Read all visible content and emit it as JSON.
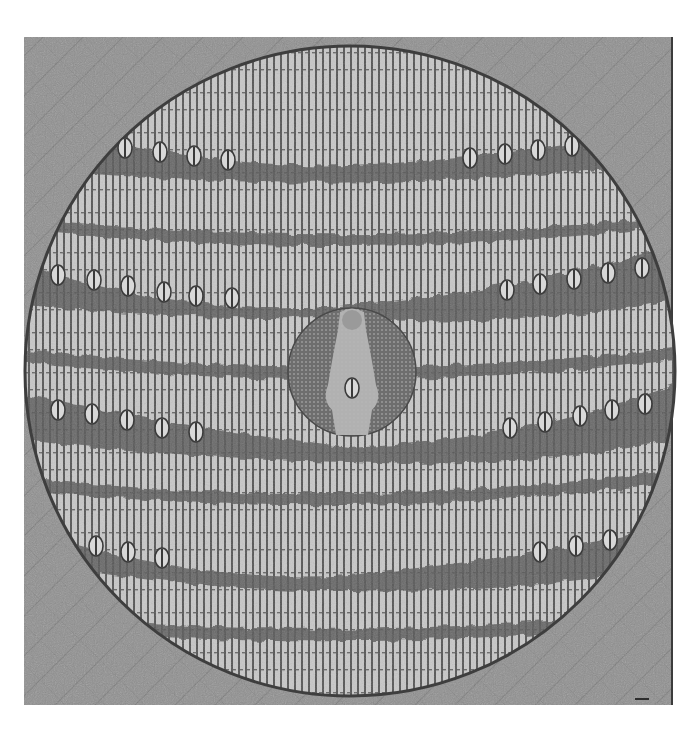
{
  "image": {
    "subject": "photograph of a square painting with a large circular woven-texture disc",
    "background_color": "#ffffff",
    "panel": {
      "x": 24,
      "y": 37,
      "width": 648,
      "height": 668,
      "color": "#8e8e8e"
    },
    "disc": {
      "cx": 350,
      "cy": 371,
      "r": 325,
      "base_color": "#c4c4c4",
      "stripe_color": "#5e5e5e",
      "stripe_spacing": 7
    },
    "bands": [
      {
        "y_left": 150,
        "y_mid": 165,
        "y_right": 148,
        "eyes": "both-sides"
      },
      {
        "y_left": 218,
        "y_mid": 238,
        "y_right": 215,
        "eyes": "none"
      },
      {
        "y_left": 282,
        "y_mid": 300,
        "y_right": 275,
        "eyes": "both-sides"
      },
      {
        "y_left": 350,
        "y_mid": 368,
        "y_right": 348,
        "eyes": "none"
      },
      {
        "y_left": 415,
        "y_mid": 440,
        "y_right": 410,
        "eyes": "both-sides"
      },
      {
        "y_left": 478,
        "y_mid": 495,
        "y_right": 470,
        "eyes": "none"
      },
      {
        "y_left": 548,
        "y_mid": 565,
        "y_right": 540,
        "eyes": "both-sides"
      },
      {
        "y_left": 615,
        "y_mid": 630,
        "y_right": 610,
        "eyes": "none"
      }
    ],
    "medallion": {
      "cx": 352,
      "cy": 372,
      "r": 64,
      "color": "#7a7a7a",
      "figure_color": "#b8b8b8"
    },
    "caption": "Circular woven-pattern painting with central medallion figure"
  }
}
